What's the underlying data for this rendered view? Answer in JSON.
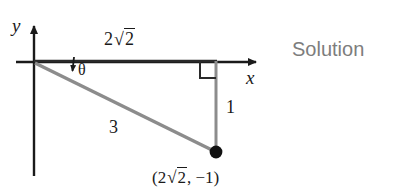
{
  "figure": {
    "title_text": "Solution",
    "axes": {
      "y_axis_label": "y",
      "x_axis_label": "x"
    },
    "labels": {
      "adjacent_side": "2√2",
      "adjacent_side_coefficient": "2",
      "adjacent_side_radicand": "2",
      "angle": "θ",
      "hypotenuse": "3",
      "opposite_side": "1",
      "point_coordinates": "(2√2, −1)",
      "point_coordinates_prefix": "(2",
      "point_coordinates_radicand": "2",
      "point_coordinates_suffix": ", −1)"
    },
    "colors": {
      "axis": "#1a1a1a",
      "ray": "#8c8c8c",
      "point": "#111111",
      "solution_text": "#7d7d7d",
      "background": "#ffffff"
    },
    "geometry": {
      "origin": [
        34,
        62
      ],
      "point": [
        216,
        152
      ],
      "x_axis_end": [
        262,
        62
      ],
      "y_axis_top": [
        34,
        22
      ],
      "y_axis_bottom": [
        34,
        176
      ],
      "right_angle_marker": [
        200,
        62,
        16,
        16
      ]
    }
  }
}
